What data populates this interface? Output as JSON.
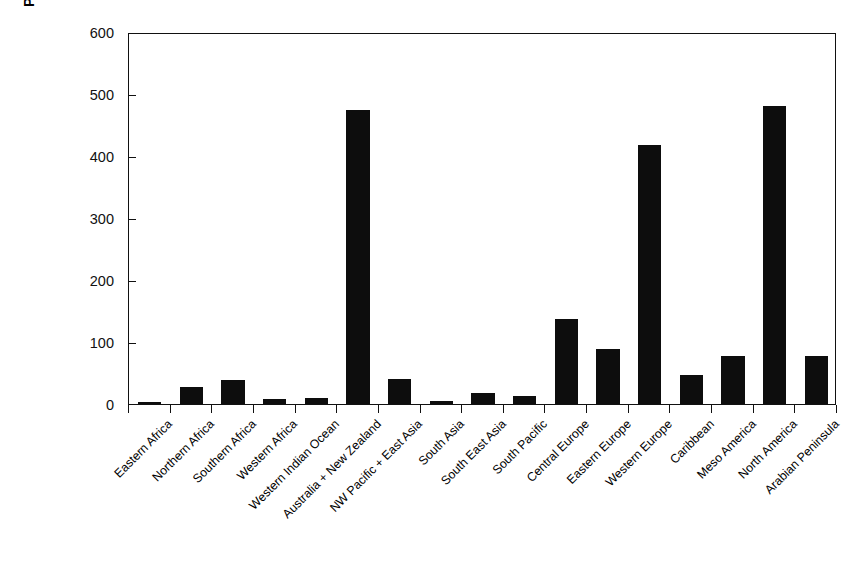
{
  "chart_data": {
    "type": "bar",
    "title": "",
    "xlabel": "",
    "ylabel": "Passenger cars per 1000 people",
    "ylim": [
      0,
      600
    ],
    "yticks": [
      0,
      100,
      200,
      300,
      400,
      500,
      600
    ],
    "grid": false,
    "legend": null,
    "bar_color": "#0d0d0d",
    "categories": [
      "Eastern Africa",
      "Northern Africa",
      "Southern Africa",
      "Western Africa",
      "Western Indian Ocean",
      "Australia + New Zealand",
      "NW Pacific + East Asia",
      "South Asia",
      "South East Asia",
      "South Pacific",
      "Central Europe",
      "Eastern Europe",
      "Western Europe",
      "Caribbean",
      "Meso America",
      "North America",
      "Arabian Peninsula"
    ],
    "values": [
      4,
      28,
      38,
      8,
      10,
      474,
      41,
      5,
      18,
      13,
      137,
      88,
      418,
      47,
      78,
      481,
      77
    ]
  }
}
